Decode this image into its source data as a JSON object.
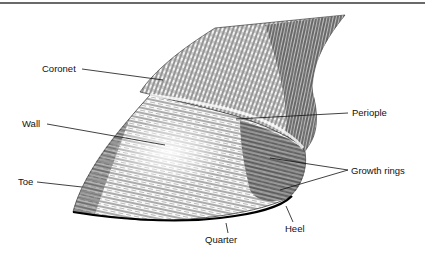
{
  "diagram": {
    "labels": {
      "coronet": "Coronet",
      "periople": "Periople",
      "wall": "Wall",
      "growth_rings": "Growth rings",
      "toe": "Toe",
      "quarter": "Quarter",
      "heel": "Heel"
    },
    "colors": {
      "ink": "#111111",
      "background": "#ffffff",
      "rule": "#6a6a6a"
    }
  }
}
